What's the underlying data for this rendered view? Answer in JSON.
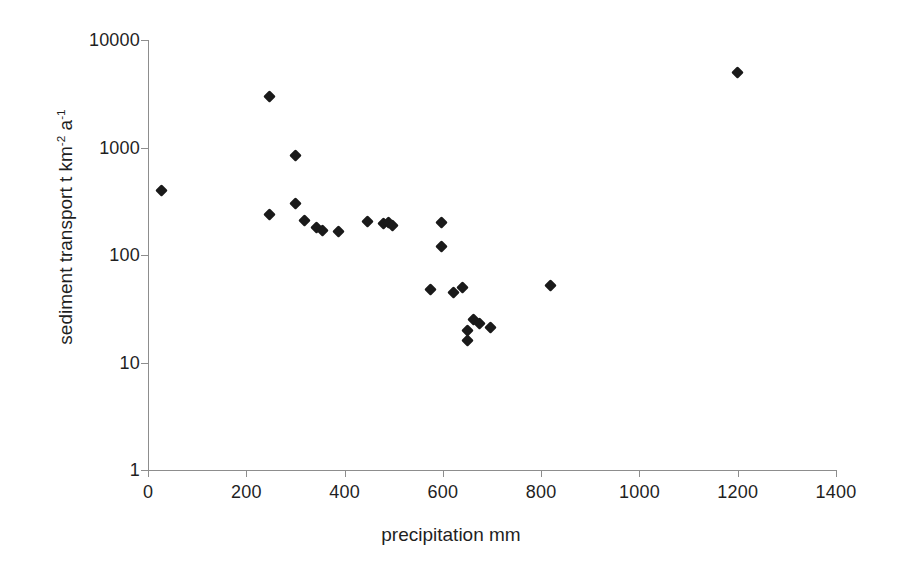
{
  "chart_data": {
    "type": "scatter",
    "title": "",
    "xlabel": "precipitation mm",
    "ylabel_parts": {
      "main": "sediment transport  t km",
      "sup1": "-2",
      "mid": " a",
      "sup2": "-1"
    },
    "ylabel": "sediment transport t km-2 a-1",
    "xlim": [
      0,
      1400
    ],
    "ylim": [
      1,
      10000
    ],
    "yscale": "log",
    "xscale": "linear",
    "grid": false,
    "legend": null,
    "xticks": [
      0,
      200,
      400,
      600,
      800,
      1000,
      1200,
      1400
    ],
    "xtick_labels": [
      "0",
      "200",
      "400",
      "600",
      "800",
      "1000",
      "1200",
      "1400"
    ],
    "yticks": [
      1,
      10,
      100,
      1000,
      10000
    ],
    "ytick_labels": [
      "1",
      "10",
      "100",
      "1000",
      "10000"
    ],
    "marker": "diamond",
    "marker_color": "#1a1a1a",
    "points": [
      {
        "x": 27,
        "y": 400
      },
      {
        "x": 247,
        "y": 3000
      },
      {
        "x": 247,
        "y": 240
      },
      {
        "x": 300,
        "y": 850
      },
      {
        "x": 300,
        "y": 300
      },
      {
        "x": 318,
        "y": 210
      },
      {
        "x": 343,
        "y": 180
      },
      {
        "x": 355,
        "y": 170
      },
      {
        "x": 387,
        "y": 165
      },
      {
        "x": 447,
        "y": 205
      },
      {
        "x": 480,
        "y": 195
      },
      {
        "x": 490,
        "y": 200
      },
      {
        "x": 497,
        "y": 190
      },
      {
        "x": 575,
        "y": 48
      },
      {
        "x": 597,
        "y": 200
      },
      {
        "x": 597,
        "y": 120
      },
      {
        "x": 622,
        "y": 45
      },
      {
        "x": 640,
        "y": 50
      },
      {
        "x": 650,
        "y": 20
      },
      {
        "x": 650,
        "y": 16
      },
      {
        "x": 663,
        "y": 25
      },
      {
        "x": 675,
        "y": 23
      },
      {
        "x": 697,
        "y": 21
      },
      {
        "x": 820,
        "y": 52
      },
      {
        "x": 1200,
        "y": 5000
      }
    ]
  }
}
